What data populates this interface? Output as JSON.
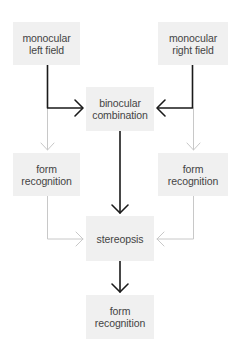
{
  "diagram": {
    "nodes": {
      "left_field": {
        "line1": "monocular",
        "line2": "left field"
      },
      "right_field": {
        "line1": "monocular",
        "line2": "right field"
      },
      "binocular": {
        "line1": "binocular",
        "line2": "combination"
      },
      "form_left": {
        "line1": "form",
        "line2": "recognition"
      },
      "form_right": {
        "line1": "form",
        "line2": "recognition"
      },
      "stereopsis": {
        "line1": "stereopsis"
      },
      "form_bottom": {
        "line1": "form",
        "line2": "recognition"
      }
    },
    "edges": [
      {
        "from": "monocular left field",
        "to": "binocular combination",
        "style": "dark"
      },
      {
        "from": "monocular right field",
        "to": "binocular combination",
        "style": "dark"
      },
      {
        "from": "monocular left field",
        "to": "form recognition (left)",
        "style": "light"
      },
      {
        "from": "monocular right field",
        "to": "form recognition (right)",
        "style": "light"
      },
      {
        "from": "binocular combination",
        "to": "stereopsis",
        "style": "dark"
      },
      {
        "from": "form recognition (left)",
        "to": "stereopsis",
        "style": "light"
      },
      {
        "from": "form recognition (right)",
        "to": "stereopsis",
        "style": "light"
      },
      {
        "from": "stereopsis",
        "to": "form recognition (bottom)",
        "style": "dark"
      }
    ],
    "colors": {
      "box": "#f0f0f0",
      "dark_line": "#1a1a1a",
      "light_line": "#c8c8c8",
      "text": "#444444"
    }
  }
}
